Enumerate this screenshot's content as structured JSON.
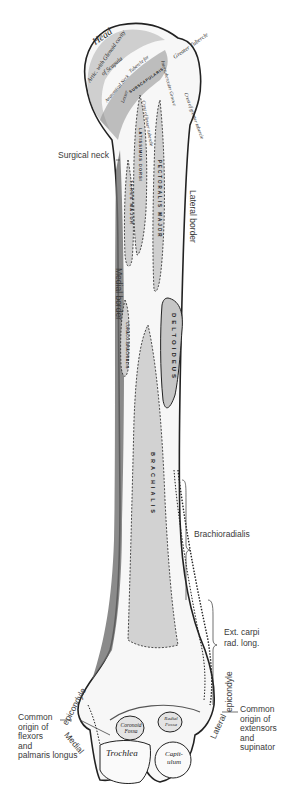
{
  "figure": {
    "labels": {
      "surgical_neck": "Surgical neck",
      "lateral_border": "Lateral border",
      "medial_border": "Medial border",
      "brachioradialis": "Brachioradialis",
      "ext_carpi_1": "Ext. carpi",
      "ext_carpi_2": "rad. long.",
      "lateral_epicondyle": "epicondyle",
      "lateral": "Lateral",
      "medial_epicondyle": "epicondyle",
      "medial": "Medial",
      "flexor_origin": [
        "Common",
        "origin of",
        "flexors",
        "and",
        "palmaris longus"
      ],
      "extensor_origin": [
        "Common",
        "origin of",
        "extensors",
        "and",
        "supinator"
      ]
    },
    "engraved": {
      "head": "Head",
      "glenoid": "Artic. with Glenoid cavity",
      "scapula": "of Scapula",
      "anatomical_neck": "Anatomical Neck",
      "greater_tubercle": "Greater Tubercle",
      "crest_greater": "Crest of greater tubercle",
      "lesser_tubercle": "Lesser",
      "subscapularis": "SUBSCAPULARIS",
      "tubercle_for": "Tubercle for",
      "intertubercular": "Intertubercular Groove",
      "crest_lesser": "Crest of lesser tubercle",
      "coronoid": "Coronoid Fossa",
      "radial": "Radial Fossa",
      "trochlea": "Trochlea",
      "capitulum": "Capit- ulum"
    },
    "muscles": {
      "latissimus": "LATISSIMUS DORSI",
      "teres": "TERES MAJOR",
      "pectoralis": "PECTORALIS MAJOR",
      "deltoideus": "DELTOIDEUS",
      "coraco": "CORACO-BRACHIALIS",
      "brachialis": "BRACHIALIS",
      "pronator": "PRONATOR"
    },
    "colors": {
      "bone": "#ffffff",
      "shade": "#9a9a9a",
      "dark": "#333333",
      "muscle_area": "#c8c8c8",
      "outline": "#222222"
    }
  }
}
